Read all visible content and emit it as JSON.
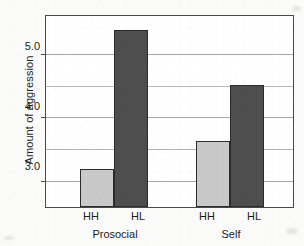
{
  "chart_data": {
    "type": "bar",
    "title": "",
    "xlabel": "",
    "ylabel": "Amount of aggression",
    "ylim": [
      2.6,
      5.6
    ],
    "ytick_labels": [
      "3.0",
      "4.0",
      "5.0"
    ],
    "ytick_values": [
      3.0,
      4.0,
      5.0
    ],
    "gridlines": [
      3.0,
      3.5,
      4.0,
      4.5,
      5.0
    ],
    "grid": true,
    "legend": "none",
    "groups": [
      "Prosocial",
      "Self"
    ],
    "categories": [
      "HH",
      "HL"
    ],
    "series": [
      {
        "name": "HH",
        "values": [
          3.2,
          3.65
        ],
        "color": "#c9c9c9"
      },
      {
        "name": "HL",
        "values": [
          5.4,
          4.52
        ],
        "color": "#4e4e4e"
      }
    ],
    "bars": [
      {
        "group": "Prosocial",
        "category": "HH",
        "value": 3.2,
        "color": "#c9c9c9"
      },
      {
        "group": "Prosocial",
        "category": "HL",
        "value": 5.4,
        "color": "#4e4e4e"
      },
      {
        "group": "Self",
        "category": "HH",
        "value": 3.65,
        "color": "#c9c9c9"
      },
      {
        "group": "Self",
        "category": "HL",
        "value": 4.52,
        "color": "#4e4e4e"
      }
    ]
  },
  "axis": {
    "y_title": "Amount of aggression",
    "tick_0": "3.0",
    "tick_1": "4.0",
    "tick_2": "5.0"
  },
  "xaxis": {
    "tick_labels": [
      "HH",
      "HL",
      "HH",
      "HL"
    ],
    "group_labels": [
      "Prosocial",
      "Self"
    ]
  },
  "colors": {
    "bar_light": "#c9c9c9",
    "bar_dark": "#4e4e4e",
    "frame": "#4a4a4a",
    "grid": "#b9b9b9",
    "text": "#1c1c1c",
    "background": "#fbfbfa"
  }
}
